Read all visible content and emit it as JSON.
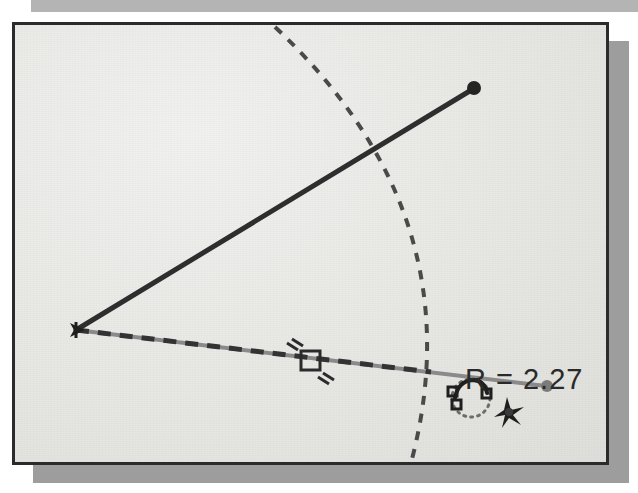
{
  "window": {
    "title": "CAD Sketch Viewport",
    "background_color": "#e9e9e7",
    "frame_color": "#2b2b2b",
    "shadow_color": "#9d9d9d",
    "top_band_color": "#b4b4b4"
  },
  "sketch": {
    "radius_label": "R = 2.27",
    "label_color": "#2a2a2a",
    "vertex_point": {
      "x": 73,
      "y": 327
    },
    "solid_line": {
      "name": "upper-construction-line",
      "from": {
        "x": 73,
        "y": 327
      },
      "to": {
        "x": 470,
        "y": 86
      },
      "color": "#2e2e2e",
      "width": 5,
      "style": "solid",
      "endpoint_marker": "filled-dot"
    },
    "dashed_line": {
      "name": "lower-dimension-line",
      "from": {
        "x": 73,
        "y": 327
      },
      "to": {
        "x": 543,
        "y": 383
      },
      "base_color": "#8a8a8a",
      "dash_color": "#333333",
      "width": 4,
      "style": "dashed-over-solid",
      "dash_end_x": 428,
      "endpoint_marker": "filled-dot-grey"
    },
    "arc": {
      "name": "radius-arc",
      "style": "dashed",
      "color": "#4a4a4a",
      "width": 4,
      "dash_pattern": "9 9",
      "start": {
        "x": 272,
        "y": 24
      },
      "control": {
        "x": 470,
        "y": 200
      },
      "end": {
        "x": 409,
        "y": 456
      }
    },
    "midpoint_handle": {
      "name": "midpoint-constraint-handle",
      "x": 306,
      "y": 357,
      "size": 17,
      "color": "#2b2b2b",
      "tick_count": 4
    },
    "cursor_rotate": {
      "name": "rotate-cursor",
      "x": 455,
      "y": 382,
      "color": "#1f1f1f"
    },
    "cursor_pan": {
      "name": "pan-cursor",
      "x": 489,
      "y": 394,
      "color": "#1f1f1f"
    }
  }
}
